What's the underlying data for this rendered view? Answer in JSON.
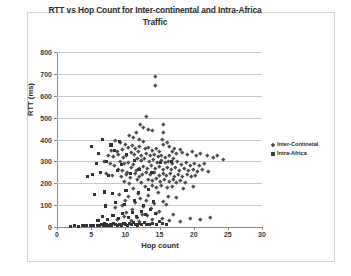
{
  "chart_data": {
    "type": "scatter",
    "title": "RTT vs Hop Count for Inter-continental and Intra-Africa Traffic",
    "title_line1": "RTT vs Hop Count for Inter-continental and Intra-Africa",
    "title_line2": "Traffic",
    "xlabel": "Hop count",
    "ylabel": "RTT (ms)",
    "xlim": [
      0,
      30
    ],
    "ylim": [
      0,
      800
    ],
    "xticks": [
      0,
      5,
      10,
      15,
      20,
      25,
      30
    ],
    "yticks": [
      0,
      100,
      200,
      300,
      400,
      500,
      600,
      700,
      800
    ],
    "grid": "horizontal",
    "legend_position": "right",
    "series": [
      {
        "name": "Inter-Continetal",
        "marker": "diamond",
        "color": "#4d4d4d",
        "points": [
          [
            14.4,
            690
          ],
          [
            14.4,
            648
          ],
          [
            13.0,
            505
          ],
          [
            12.2,
            470
          ],
          [
            15.5,
            468
          ],
          [
            15.6,
            432
          ],
          [
            12.7,
            455
          ],
          [
            13.3,
            448
          ],
          [
            13.9,
            440
          ],
          [
            11.6,
            432
          ],
          [
            15.4,
            400
          ],
          [
            15.5,
            378
          ],
          [
            10.6,
            420
          ],
          [
            11.1,
            410
          ],
          [
            8.6,
            395
          ],
          [
            9.3,
            385
          ],
          [
            12.0,
            402
          ],
          [
            12.6,
            392
          ],
          [
            16.1,
            386
          ],
          [
            16.4,
            370
          ],
          [
            17.2,
            362
          ],
          [
            18.0,
            355
          ],
          [
            10.0,
            378
          ],
          [
            10.4,
            366
          ],
          [
            11.0,
            372
          ],
          [
            11.5,
            360
          ],
          [
            12.1,
            370
          ],
          [
            12.9,
            358
          ],
          [
            13.4,
            366
          ],
          [
            14.0,
            352
          ],
          [
            14.6,
            360
          ],
          [
            15.0,
            348
          ],
          [
            8.0,
            352
          ],
          [
            8.8,
            344
          ],
          [
            9.5,
            356
          ],
          [
            16.8,
            344
          ],
          [
            17.4,
            336
          ],
          [
            18.3,
            340
          ],
          [
            19.0,
            332
          ],
          [
            19.8,
            345
          ],
          [
            20.4,
            330
          ],
          [
            21.0,
            338
          ],
          [
            10.8,
            340
          ],
          [
            11.3,
            332
          ],
          [
            11.9,
            344
          ],
          [
            12.4,
            330
          ],
          [
            13.1,
            338
          ],
          [
            13.7,
            326
          ],
          [
            14.2,
            334
          ],
          [
            14.8,
            322
          ],
          [
            15.3,
            330
          ],
          [
            15.9,
            318
          ],
          [
            16.5,
            326
          ],
          [
            17.0,
            314
          ],
          [
            7.5,
            330
          ],
          [
            8.2,
            322
          ],
          [
            9.0,
            334
          ],
          [
            9.7,
            318
          ],
          [
            10.2,
            326
          ],
          [
            22.0,
            330
          ],
          [
            22.8,
            318
          ],
          [
            23.5,
            326
          ],
          [
            24.3,
            310
          ],
          [
            11.7,
            312
          ],
          [
            12.3,
            304
          ],
          [
            12.8,
            316
          ],
          [
            13.5,
            300
          ],
          [
            14.1,
            308
          ],
          [
            14.7,
            296
          ],
          [
            15.2,
            306
          ],
          [
            15.8,
            294
          ],
          [
            16.3,
            302
          ],
          [
            16.9,
            290
          ],
          [
            17.6,
            300
          ],
          [
            18.2,
            288
          ],
          [
            18.9,
            296
          ],
          [
            19.5,
            284
          ],
          [
            20.1,
            292
          ],
          [
            20.8,
            280
          ],
          [
            21.5,
            290
          ],
          [
            9.2,
            300
          ],
          [
            9.9,
            290
          ],
          [
            10.5,
            298
          ],
          [
            11.2,
            286
          ],
          [
            6.9,
            300
          ],
          [
            7.8,
            292
          ],
          [
            8.4,
            284
          ],
          [
            12.6,
            278
          ],
          [
            13.2,
            270
          ],
          [
            13.8,
            280
          ],
          [
            14.4,
            268
          ],
          [
            15.0,
            276
          ],
          [
            15.6,
            264
          ],
          [
            16.2,
            274
          ],
          [
            16.7,
            262
          ],
          [
            17.3,
            272
          ],
          [
            17.9,
            260
          ],
          [
            18.6,
            270
          ],
          [
            19.2,
            258
          ],
          [
            19.9,
            266
          ],
          [
            20.6,
            256
          ],
          [
            21.3,
            264
          ],
          [
            22.2,
            254
          ],
          [
            10.9,
            272
          ],
          [
            11.6,
            260
          ],
          [
            12.1,
            268
          ],
          [
            8.9,
            266
          ],
          [
            9.6,
            258
          ],
          [
            10.3,
            250
          ],
          [
            13.0,
            248
          ],
          [
            13.6,
            240
          ],
          [
            14.3,
            250
          ],
          [
            14.9,
            238
          ],
          [
            15.5,
            246
          ],
          [
            16.0,
            236
          ],
          [
            16.6,
            244
          ],
          [
            17.1,
            234
          ],
          [
            17.8,
            242
          ],
          [
            18.4,
            232
          ],
          [
            19.1,
            240
          ],
          [
            19.7,
            230
          ],
          [
            20.3,
            238
          ],
          [
            11.4,
            244
          ],
          [
            12.0,
            234
          ],
          [
            12.5,
            242
          ],
          [
            7.2,
            246
          ],
          [
            8.1,
            238
          ],
          [
            9.4,
            230
          ],
          [
            10.1,
            240
          ],
          [
            10.7,
            228
          ],
          [
            13.3,
            220
          ],
          [
            14.0,
            212
          ],
          [
            14.6,
            222
          ],
          [
            15.1,
            210
          ],
          [
            15.7,
            218
          ],
          [
            16.4,
            208
          ],
          [
            17.0,
            216
          ],
          [
            17.5,
            206
          ],
          [
            18.1,
            214
          ],
          [
            18.8,
            204
          ],
          [
            11.8,
            216
          ],
          [
            12.4,
            206
          ],
          [
            9.8,
            210
          ],
          [
            10.6,
            202
          ],
          [
            13.9,
            190
          ],
          [
            14.5,
            182
          ],
          [
            15.2,
            192
          ],
          [
            16.1,
            180
          ],
          [
            12.9,
            186
          ],
          [
            11.1,
            178
          ],
          [
            16.8,
            188
          ],
          [
            18.5,
            176
          ],
          [
            20.0,
            184
          ],
          [
            9.1,
            150
          ],
          [
            10.4,
            140
          ],
          [
            11.9,
            155
          ],
          [
            13.4,
            145
          ],
          [
            14.8,
            158
          ],
          [
            16.3,
            142
          ],
          [
            12.2,
            132
          ],
          [
            17.5,
            136
          ],
          [
            10.0,
            120
          ],
          [
            11.5,
            112
          ],
          [
            13.0,
            124
          ],
          [
            14.2,
            108
          ],
          [
            15.6,
            118
          ],
          [
            9.5,
            100
          ],
          [
            12.7,
            96
          ],
          [
            16.0,
            104
          ],
          [
            8.5,
            88
          ],
          [
            11.0,
            80
          ],
          [
            13.8,
            84
          ],
          [
            15.0,
            72
          ],
          [
            10.2,
            68
          ],
          [
            12.5,
            60
          ],
          [
            14.5,
            64
          ],
          [
            17.0,
            56
          ],
          [
            9.8,
            48
          ],
          [
            11.7,
            44
          ],
          [
            13.2,
            52
          ],
          [
            15.4,
            40
          ],
          [
            8.8,
            36
          ],
          [
            10.9,
            32
          ],
          [
            12.0,
            28
          ],
          [
            14.0,
            34
          ],
          [
            16.5,
            30
          ],
          [
            18.0,
            26
          ],
          [
            19.5,
            40
          ],
          [
            21.0,
            36
          ],
          [
            22.5,
            44
          ]
        ]
      },
      {
        "name": "Intra-Africa",
        "marker": "square",
        "color": "#333333",
        "points": [
          [
            2.0,
            4
          ],
          [
            2.6,
            5
          ],
          [
            3.2,
            4
          ],
          [
            3.8,
            6
          ],
          [
            4.3,
            5
          ],
          [
            4.9,
            7
          ],
          [
            5.4,
            5
          ],
          [
            5.9,
            8
          ],
          [
            6.2,
            6
          ],
          [
            6.5,
            10
          ],
          [
            6.8,
            7
          ],
          [
            7.0,
            14
          ],
          [
            7.2,
            9
          ],
          [
            7.5,
            6
          ],
          [
            7.8,
            12
          ],
          [
            8.0,
            8
          ],
          [
            8.3,
            16
          ],
          [
            8.6,
            10
          ],
          [
            8.9,
            7
          ],
          [
            9.2,
            13
          ],
          [
            9.5,
            9
          ],
          [
            9.8,
            18
          ],
          [
            10.0,
            11
          ],
          [
            10.3,
            8
          ],
          [
            10.6,
            15
          ],
          [
            10.9,
            10
          ],
          [
            11.2,
            20
          ],
          [
            11.5,
            12
          ],
          [
            11.8,
            9
          ],
          [
            12.1,
            16
          ],
          [
            12.4,
            11
          ],
          [
            12.8,
            22
          ],
          [
            13.1,
            13
          ],
          [
            13.5,
            10
          ],
          [
            14.0,
            18
          ],
          [
            14.5,
            12
          ],
          [
            15.0,
            24
          ],
          [
            15.5,
            14
          ],
          [
            16.0,
            11
          ],
          [
            6.0,
            30
          ],
          [
            6.6,
            48
          ],
          [
            7.4,
            36
          ],
          [
            8.2,
            52
          ],
          [
            9.0,
            40
          ],
          [
            9.6,
            60
          ],
          [
            10.4,
            44
          ],
          [
            11.0,
            66
          ],
          [
            11.6,
            50
          ],
          [
            12.3,
            72
          ],
          [
            13.0,
            56
          ],
          [
            13.7,
            80
          ],
          [
            14.4,
            62
          ],
          [
            7.1,
            96
          ],
          [
            8.5,
            110
          ],
          [
            9.9,
            104
          ],
          [
            11.3,
            120
          ],
          [
            12.6,
            100
          ],
          [
            14.1,
            116
          ],
          [
            5.5,
            148
          ],
          [
            6.9,
            160
          ],
          [
            8.1,
            152
          ],
          [
            10.1,
            166
          ],
          [
            11.9,
            158
          ],
          [
            13.4,
            170
          ],
          [
            4.5,
            232
          ],
          [
            5.2,
            240
          ],
          [
            6.4,
            250
          ],
          [
            7.6,
            236
          ],
          [
            8.8,
            258
          ],
          [
            10.7,
            244
          ],
          [
            12.0,
            262
          ],
          [
            13.9,
            248
          ],
          [
            5.8,
            290
          ],
          [
            7.3,
            300
          ],
          [
            9.4,
            286
          ],
          [
            11.4,
            306
          ],
          [
            15.2,
            294
          ],
          [
            16.7,
            300
          ],
          [
            6.1,
            338
          ],
          [
            8.4,
            348
          ],
          [
            10.2,
            330
          ],
          [
            5.0,
            366
          ],
          [
            7.9,
            375
          ],
          [
            6.7,
            398
          ],
          [
            9.1,
            392
          ]
        ]
      }
    ]
  }
}
